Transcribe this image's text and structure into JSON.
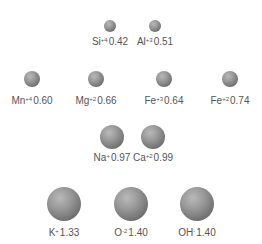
{
  "diagram": {
    "title": "",
    "ions": [
      {
        "id": "si",
        "symbol": "Si",
        "charge": "+4",
        "radius": "0.42",
        "cx": 110,
        "cy": 26,
        "r": 6,
        "label_y": 37
      },
      {
        "id": "al",
        "symbol": "Al",
        "charge": "+3",
        "radius": "0.51",
        "cx": 155,
        "cy": 26,
        "r": 6,
        "label_y": 37
      },
      {
        "id": "mn",
        "symbol": "Mn",
        "charge": "+4",
        "radius": "0.60",
        "cx": 32,
        "cy": 79,
        "r": 8,
        "label_y": 96
      },
      {
        "id": "mg",
        "symbol": "Mg",
        "charge": "+2",
        "radius": "0.66",
        "cx": 96,
        "cy": 79,
        "r": 8,
        "label_y": 96
      },
      {
        "id": "fe3",
        "symbol": "Fe",
        "charge": "+3",
        "radius": "0.64",
        "cx": 164,
        "cy": 79,
        "r": 8,
        "label_y": 96
      },
      {
        "id": "fe2",
        "symbol": "Fe",
        "charge": "+2",
        "radius": "0.74",
        "cx": 230,
        "cy": 79,
        "r": 8,
        "label_y": 96
      },
      {
        "id": "na",
        "symbol": "Na",
        "charge": "+",
        "radius": "0.97",
        "cx": 112,
        "cy": 137,
        "r": 12,
        "label_y": 153
      },
      {
        "id": "ca",
        "symbol": "Ca",
        "charge": "+2",
        "radius": "0.99",
        "cx": 153,
        "cy": 137,
        "r": 12,
        "label_y": 153
      },
      {
        "id": "k",
        "symbol": "K",
        "charge": "+",
        "radius": "1.33",
        "cx": 64,
        "cy": 204,
        "r": 17,
        "label_y": 228
      },
      {
        "id": "o",
        "symbol": "O",
        "charge": "-2",
        "radius": "1.40",
        "cx": 131,
        "cy": 204,
        "r": 17,
        "label_y": 228
      },
      {
        "id": "oh",
        "symbol": "OH",
        "charge": "-",
        "radius": "1.40",
        "cx": 197,
        "cy": 204,
        "r": 17,
        "label_y": 228
      }
    ]
  }
}
